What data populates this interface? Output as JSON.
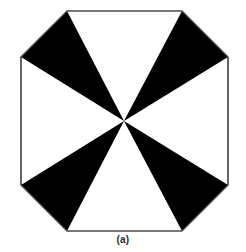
{
  "figure": {
    "caption": "(a)",
    "background_color": "#ffffff",
    "outline_color": "#4a4a4a",
    "outline_width": 1.2,
    "fill_color": "#ffffff",
    "wedge_color": "#000000",
    "center": {
      "x": 124,
      "y": 121
    },
    "octagon_vertices": [
      {
        "name": "top-left",
        "x": 67,
        "y": 11
      },
      {
        "name": "top-right",
        "x": 182,
        "y": 11
      },
      {
        "name": "right-top",
        "x": 228,
        "y": 57
      },
      {
        "name": "right-bottom",
        "x": 228,
        "y": 185
      },
      {
        "name": "bottom-right",
        "x": 182,
        "y": 231
      },
      {
        "name": "bottom-left",
        "x": 67,
        "y": 231
      },
      {
        "name": "left-bottom",
        "x": 21,
        "y": 185
      },
      {
        "name": "left-top",
        "x": 21,
        "y": 57
      }
    ],
    "wedges": [
      {
        "name": "wedge-top-left",
        "points": "124,121 67,11 21,57",
        "fill": "#000000"
      },
      {
        "name": "wedge-top-right",
        "points": "124,121 182,11 228,57",
        "fill": "#000000"
      },
      {
        "name": "wedge-bottom-right",
        "points": "124,121 228,185 182,231",
        "fill": "#000000"
      },
      {
        "name": "wedge-bottom-left",
        "points": "124,121 21,185 67,231",
        "fill": "#000000"
      }
    ],
    "octagon_path": "67,11 182,11 228,57 228,185 182,231 67,231 21,185 21,57"
  }
}
